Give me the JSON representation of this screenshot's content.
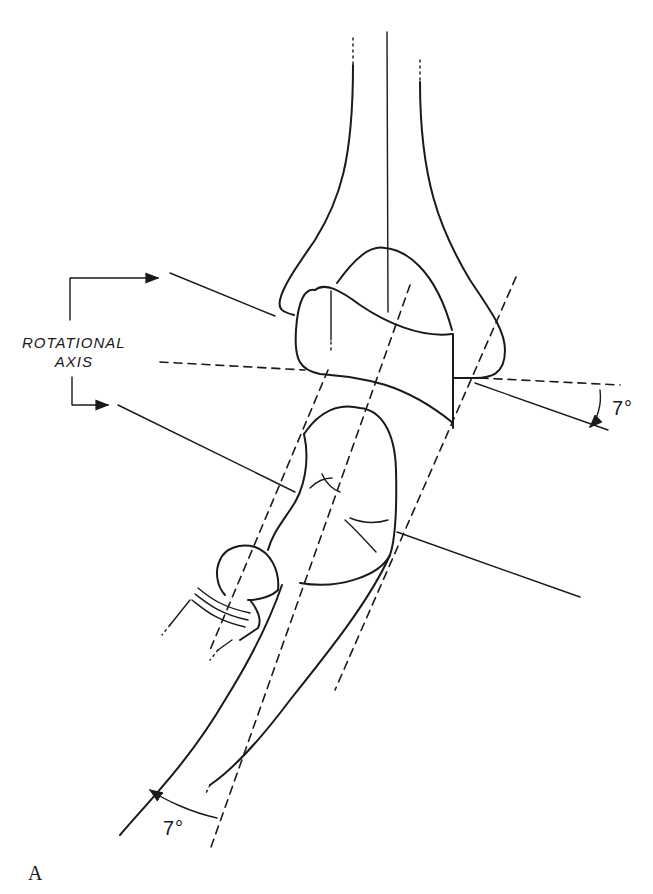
{
  "figure": {
    "panel_label": "A",
    "labels": {
      "rotational_axis_line1": "ROTATIONAL",
      "rotational_axis_line2": "AXIS",
      "angle_upper": "7°",
      "angle_lower": "7°"
    },
    "annotations": [
      {
        "id": "rotational-axis-bracket",
        "description": "Bracket with two arrows pointing to two parallel lines through the elbow joint"
      },
      {
        "id": "upper-angle",
        "value": "7°",
        "description": "Angle between horizontal dashed reference and rotational axis line"
      },
      {
        "id": "lower-angle",
        "value": "7°",
        "description": "Angle between forearm (ulna) axis and dashed reference line"
      }
    ],
    "line_color": "#1a1a1a",
    "background": "#ffffff"
  }
}
